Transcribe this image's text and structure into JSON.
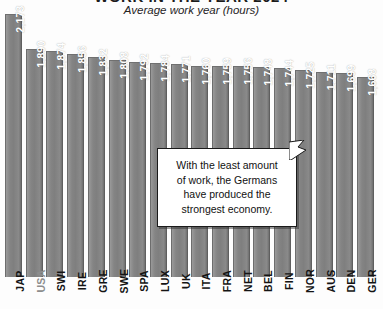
{
  "chart_data": {
    "type": "bar",
    "title": "WORK IN THE YEAR 2024",
    "subtitle": "Average work year (hours)",
    "xlabel": "",
    "ylabel": "",
    "ylim": [
      0,
      2173
    ],
    "grid": false,
    "legend": "none",
    "orientation": "vertical",
    "value_label_position": "inside-top-rotated",
    "categories": [
      "JAP",
      "USA",
      "SWI",
      "IRE",
      "GRE",
      "SWE",
      "SPA",
      "LUX",
      "UK",
      "ITA",
      "FRA",
      "NET",
      "BEL",
      "FIN",
      "NOR",
      "AUS",
      "DEN",
      "GER"
    ],
    "values": [
      2173,
      1890,
      1874,
      1856,
      1832,
      1808,
      1792,
      1784,
      1771,
      1760,
      1759,
      1756,
      1748,
      1744,
      1725,
      1711,
      1699,
      1668
    ],
    "value_labels": [
      "2,173",
      "1,890",
      "1,874",
      "1,856",
      "1,832",
      "1,808",
      "1,792",
      "1,784",
      "1,771",
      "1,760",
      "1,759",
      "1,756",
      "1,748",
      "1,744",
      "1,725",
      "1,711",
      "1,699",
      "1,668"
    ],
    "annotations": [
      {
        "text": "With the least amount of work, the Germans have produced the strongest economy.",
        "points_to": "GER"
      }
    ],
    "colors": {
      "bar": "#808080",
      "bar_edge": "#6d6d6d",
      "value_label": "#ffffff",
      "category_label": "#141414",
      "category_label_dim": "#8d8d8d",
      "background": "#fdfdfd",
      "callout_background": "#ffffff",
      "callout_border": "#1a1a1a"
    }
  },
  "callout": {
    "line1": "With the least amount",
    "line2": "of work, the Germans",
    "line3": "have produced the",
    "line4": "strongest economy."
  }
}
